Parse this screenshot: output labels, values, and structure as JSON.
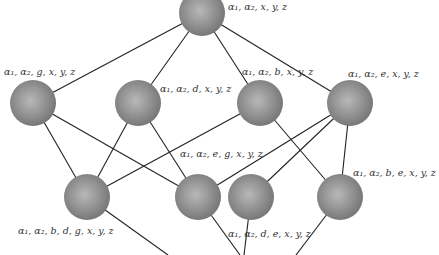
{
  "diagram": {
    "type": "lattice",
    "colors": {
      "node_fill": "#8a8a8a",
      "node_highlight": "#b5b5b5",
      "edge": "#222222",
      "label": "#333333"
    },
    "nodes": [
      {
        "id": "top",
        "label": "α₁, α₂, x, y, z",
        "cx": 202,
        "cy": 13,
        "r": 23,
        "lx": 228,
        "ly": 2
      },
      {
        "id": "g",
        "label": "α₁, α₂, g, x, y, z",
        "cx": 33,
        "cy": 103,
        "r": 23,
        "lx": 4,
        "ly": 67
      },
      {
        "id": "d",
        "label": "α₁, α₂, d, x, y, z",
        "cx": 138,
        "cy": 103,
        "r": 23,
        "lx": 160,
        "ly": 84
      },
      {
        "id": "b",
        "label": "α₁, α₂, b, x, y, z",
        "cx": 260,
        "cy": 103,
        "r": 23,
        "lx": 242,
        "ly": 67
      },
      {
        "id": "e",
        "label": "α₁, α₂, e, x, y, z",
        "cx": 350,
        "cy": 103,
        "r": 23,
        "lx": 348,
        "ly": 69
      },
      {
        "id": "bdg",
        "label": "α₁, α₂, b, d, g, x, y, z",
        "cx": 87,
        "cy": 197,
        "r": 23,
        "lx": 18,
        "ly": 226
      },
      {
        "id": "eg",
        "label": "α₁, α₂, e, g, x, y, z",
        "cx": 198,
        "cy": 197,
        "r": 23,
        "lx": 180,
        "ly": 149
      },
      {
        "id": "de",
        "label": "α₁, α₂, d, e, x, y, z",
        "cx": 251,
        "cy": 197,
        "r": 23,
        "lx": 228,
        "ly": 229
      },
      {
        "id": "be",
        "label": "α₁, α₂, b, e, x, y, z",
        "cx": 340,
        "cy": 197,
        "r": 23,
        "lx": 353,
        "ly": 168
      }
    ],
    "edges": [
      [
        "top",
        "g"
      ],
      [
        "top",
        "d"
      ],
      [
        "top",
        "b"
      ],
      [
        "top",
        "e"
      ],
      [
        "g",
        "bdg"
      ],
      [
        "g",
        "eg"
      ],
      [
        "d",
        "bdg"
      ],
      [
        "d",
        "eg"
      ],
      [
        "b",
        "bdg"
      ],
      [
        "b",
        "be"
      ],
      [
        "e",
        "eg"
      ],
      [
        "e",
        "de"
      ],
      [
        "e",
        "be"
      ]
    ],
    "dangling_edges": [
      {
        "from": "bdg",
        "x2": 168,
        "y2": 255
      },
      {
        "from": "eg",
        "x2": 240,
        "y2": 255
      },
      {
        "from": "de",
        "x2": 244,
        "y2": 255
      },
      {
        "from": "be",
        "x2": 296,
        "y2": 255
      }
    ]
  }
}
